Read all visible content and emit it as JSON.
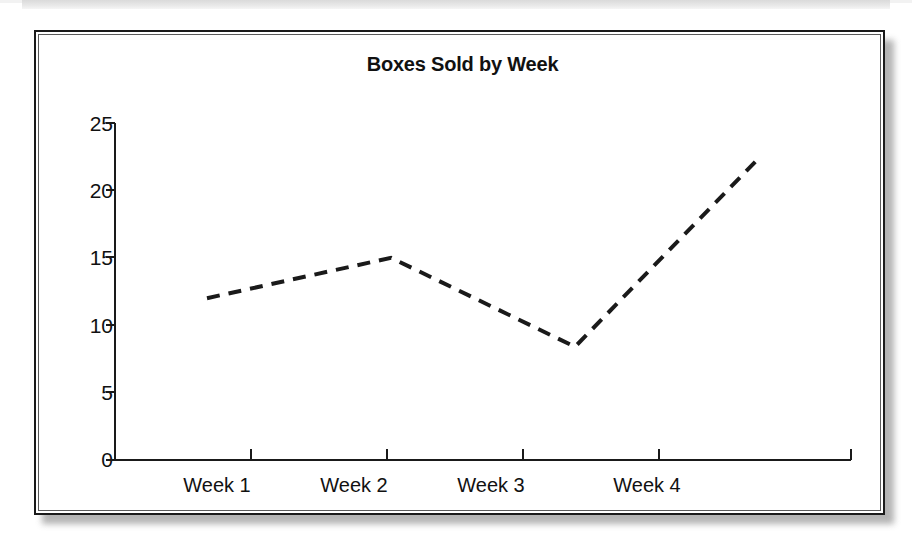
{
  "page": {
    "background_color": "#ffffff",
    "frame_border_color": "#1a1a1a"
  },
  "chart_data": {
    "type": "line",
    "title": "Boxes Sold by Week",
    "xlabel": "",
    "ylabel": "",
    "categories": [
      "Week 1",
      "Week 2",
      "Week 3",
      "Week 4"
    ],
    "values": [
      12,
      15,
      8.4,
      22.4
    ],
    "series": [
      {
        "name": "Boxes Sold",
        "values": [
          12,
          15,
          8.4,
          22.4
        ],
        "line_style": "dashed",
        "line_color": "#1a1a1a",
        "markers": "none"
      }
    ],
    "ylim": [
      0,
      25
    ],
    "yticks": [
      0,
      5,
      10,
      15,
      20,
      25
    ],
    "ytick_labels": [
      "0",
      "5",
      "10",
      "15",
      "20",
      "25"
    ],
    "xtick_labels": [
      "Week 1",
      "Week 2",
      "Week 3",
      "Week 4"
    ],
    "grid": false,
    "legend": false,
    "legend_position": "none",
    "axis_color": "#1a1a1a"
  }
}
